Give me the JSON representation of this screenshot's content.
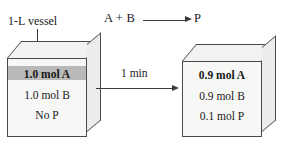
{
  "diagram": {
    "reaction_equation": {
      "reactants": "A + B",
      "product": "P",
      "arrow": "reaction-arrow"
    },
    "callout": {
      "label": "1-L vessel"
    },
    "transition": {
      "label": "1 min"
    },
    "vessels": [
      {
        "id": "initial",
        "lines": [
          {
            "text": "1.0 mol A",
            "bold": true,
            "highlighted": true
          },
          {
            "text": "1.0 mol B",
            "bold": false,
            "highlighted": false
          },
          {
            "text": "No P",
            "bold": false,
            "highlighted": false
          }
        ]
      },
      {
        "id": "final",
        "lines": [
          {
            "text": "0.9 mol A",
            "bold": true,
            "highlighted": false
          },
          {
            "text": "0.9 mol B",
            "bold": false,
            "highlighted": false
          },
          {
            "text": "0.1 mol P",
            "bold": false,
            "highlighted": false
          }
        ]
      }
    ],
    "colors": {
      "background": "#ffffff",
      "stroke": "#4a4a4a",
      "box_front": "#f7f7f6",
      "box_top": "#f2f2f0",
      "box_side": "#ececeb",
      "highlight": "#b9b9b7",
      "text": "#1a1a1a"
    }
  }
}
